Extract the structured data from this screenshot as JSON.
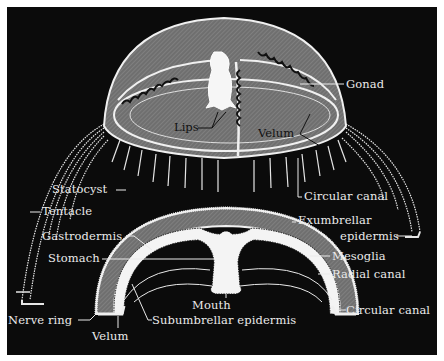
{
  "figure": {
    "background_color": "#0b0b0b",
    "bell_color": "#7a7a7a",
    "line_color": "#eaeaea"
  },
  "top_view": {
    "labels": {
      "gonad": "Gonad",
      "lips": "Lips",
      "velum": "Velum",
      "statocyst": "Statocyst",
      "circular_canal": "Circular canal",
      "tentacle": "Tentacle"
    }
  },
  "section_view": {
    "labels": {
      "gastrodermis": "Gastrodermis",
      "exumbrellar_1": "Exumbrellar",
      "exumbrellar_2": "epidermis",
      "stomach": "Stomach",
      "mesoglia": "Mesoglia",
      "radial_canal": "Radial canal",
      "mouth": "Mouth",
      "circular_canal": "Circular canal",
      "nerve_ring": "Nerve ring",
      "subumbrellar_epidermis": "Subumbrellar epidermis",
      "velum": "Velum"
    }
  }
}
